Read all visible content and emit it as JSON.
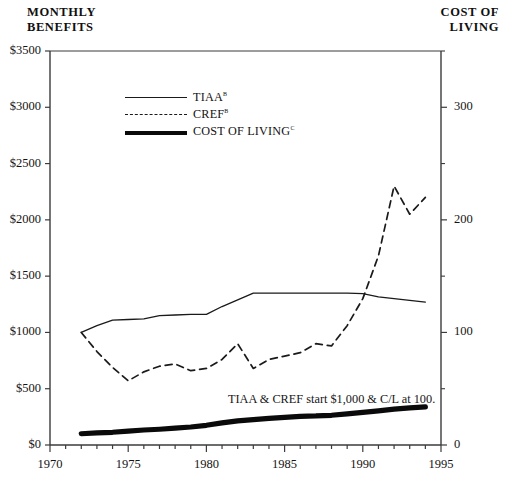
{
  "titles": {
    "left": "MONTHLY\nBENEFITS",
    "right": "COST OF\nLIVING"
  },
  "legend": {
    "position": "inside-top-left",
    "items": [
      {
        "label": "TIAA",
        "sup": "b",
        "style": "thin-solid",
        "color": "#1a1a1a",
        "name": "tiaa"
      },
      {
        "label": "CREF",
        "sup": "b",
        "style": "dashed",
        "color": "#1a1a1a",
        "name": "cref"
      },
      {
        "label": "COST OF LIVING",
        "sup": "c",
        "style": "thick-solid",
        "color": "#0a0a0a",
        "name": "cost-of-living"
      }
    ]
  },
  "annotation": "TIAA & CREF start $1,000 & C/L at 100.",
  "chart_data": {
    "type": "line",
    "title": "",
    "xlabel": "",
    "ylabel": "MONTHLY BENEFITS",
    "y2label": "COST OF LIVING",
    "xlim": [
      1970,
      1995
    ],
    "ylim": [
      0,
      3500
    ],
    "y2lim": [
      0,
      350
    ],
    "grid": false,
    "x_ticks": [
      1970,
      1975,
      1980,
      1985,
      1990,
      1995
    ],
    "x_tick_labels": [
      "1970",
      "1975",
      "1980",
      "1985",
      "1990",
      "1995"
    ],
    "x_minor_tick_step": 1,
    "y_ticks": [
      0,
      500,
      1000,
      1500,
      2000,
      2500,
      3000,
      3500
    ],
    "y_tick_labels": [
      "$0",
      "$500",
      "$1000",
      "$1500",
      "$2000",
      "$2500",
      "$3000",
      "$3500"
    ],
    "y2_ticks": [
      0,
      100,
      200,
      300
    ],
    "y2_tick_labels": [
      "0",
      "100",
      "200",
      "300"
    ],
    "y2_minor_ticks": [
      50,
      150,
      250,
      350
    ],
    "x": [
      1972,
      1973,
      1974,
      1975,
      1976,
      1977,
      1978,
      1979,
      1980,
      1981,
      1982,
      1983,
      1984,
      1985,
      1986,
      1987,
      1988,
      1989,
      1990,
      1991,
      1992,
      1993,
      1994
    ],
    "series": [
      {
        "name": "TIAA",
        "style": "thin-solid",
        "color": "#1a1a1a",
        "values": [
          1000,
          1060,
          1110,
          1115,
          1120,
          1150,
          1155,
          1160,
          1160,
          1230,
          1290,
          1350,
          1350,
          1350,
          1350,
          1350,
          1350,
          1350,
          1345,
          1315,
          1300,
          1285,
          1270
        ]
      },
      {
        "name": "CREF",
        "style": "dashed",
        "color": "#1a1a1a",
        "values": [
          1000,
          830,
          690,
          570,
          650,
          700,
          720,
          660,
          680,
          760,
          900,
          680,
          760,
          790,
          820,
          900,
          880,
          1060,
          1300,
          1680,
          2300,
          2050,
          2200
        ]
      },
      {
        "name": "COST OF LIVING",
        "style": "thick-solid",
        "color": "#0a0a0a",
        "values": [
          100,
          107,
          113,
          124,
          133,
          140,
          150,
          160,
          175,
          196,
          215,
          226,
          236,
          246,
          255,
          258,
          264,
          277,
          290,
          303,
          318,
          330,
          338
        ]
      }
    ]
  }
}
